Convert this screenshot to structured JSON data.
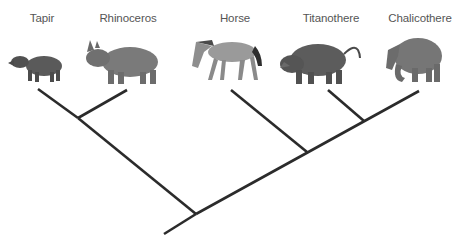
{
  "diagram": {
    "type": "phylogenetic-tree (cladogram)",
    "taxa": [
      {
        "id": "tapir",
        "label": "Tapir",
        "label_x": 42,
        "tip": [
          38,
          89
        ]
      },
      {
        "id": "rhinoceros",
        "label": "Rhinoceros",
        "label_x": 128,
        "tip": [
          127,
          90
        ]
      },
      {
        "id": "horse",
        "label": "Horse",
        "label_x": 235,
        "tip": [
          231,
          90
        ]
      },
      {
        "id": "titanothere",
        "label": "Titanothere",
        "label_x": 331,
        "tip": [
          328,
          90
        ]
      },
      {
        "id": "chalicothere",
        "label": "Chalicothere",
        "label_x": 420,
        "tip": [
          419,
          91
        ]
      }
    ],
    "topology": "((Tapir,Rhinoceros),(Horse,(Titanothere,Chalicothere)))",
    "nodes": {
      "tapir_rhino": [
        78,
        118
      ],
      "titano_chalico": [
        364,
        121
      ],
      "horse_clade": [
        307,
        152
      ],
      "root": [
        196,
        214
      ],
      "root_base": [
        164,
        234
      ]
    },
    "colors": {
      "line": "#2b2b2b",
      "label": "#555555",
      "tapir": "#5a5a5a",
      "rhinoceros": "#7a7a7a",
      "horse": "#9a9a9a",
      "titanothere": "#5c5c5c",
      "chalicothere": "#767676"
    }
  }
}
